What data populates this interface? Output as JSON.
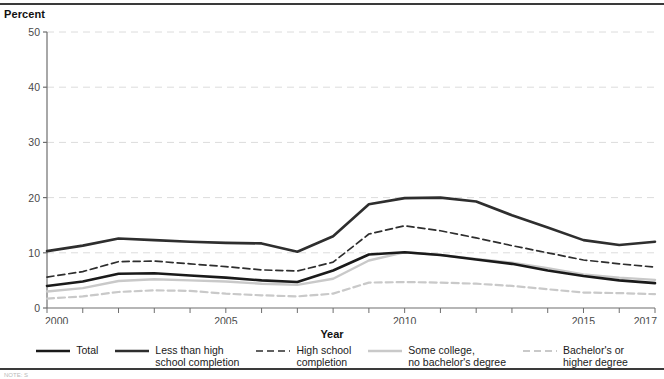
{
  "figure": {
    "y_axis_title": "Percent",
    "x_axis_title": "Year",
    "footnote": "NOTE: S"
  },
  "legend": {
    "items": [
      {
        "label": "Total",
        "style": "solid",
        "color": "#1a1a1a",
        "width": 2.6
      },
      {
        "label": "Less than high\nschool completion",
        "style": "solid",
        "color": "#2e2e2e",
        "width": 2.6
      },
      {
        "label": "High school\ncompletion",
        "style": "dashed",
        "color": "#2e2e2e",
        "width": 1.7
      },
      {
        "label": "Some college,\nno bachelor's degree",
        "style": "solid",
        "color": "#c9c9c9",
        "width": 2.4
      },
      {
        "label": "Bachelor's or\nhigher degree",
        "style": "dashed",
        "color": "#c9c9c9",
        "width": 2.2
      }
    ]
  },
  "chart_data": {
    "type": "line",
    "title": "",
    "xlabel": "Year",
    "ylabel": "Percent",
    "xlim": [
      2000,
      2017
    ],
    "ylim": [
      0,
      50
    ],
    "yticks": [
      0,
      10,
      20,
      30,
      40,
      50
    ],
    "xticks": [
      2000,
      2005,
      2010,
      2015,
      2017
    ],
    "xtick_labels": [
      "2000",
      "2005",
      "2010",
      "2015",
      "2017"
    ],
    "minor_xticks_every": 1,
    "grid": "horizontal-dashed-light",
    "legend_position": "bottom",
    "x": [
      2000,
      2001,
      2002,
      2003,
      2004,
      2005,
      2006,
      2007,
      2008,
      2009,
      2010,
      2011,
      2012,
      2013,
      2014,
      2015,
      2016,
      2017
    ],
    "series": [
      {
        "name": "Total",
        "style": "solid",
        "color": "#1a1a1a",
        "values": [
          4.0,
          4.8,
          6.2,
          6.3,
          5.9,
          5.5,
          5.0,
          4.7,
          6.8,
          9.7,
          10.1,
          9.6,
          8.8,
          8.0,
          6.8,
          5.8,
          5.0,
          4.5
        ]
      },
      {
        "name": "Less than high school completion",
        "style": "solid",
        "color": "#2e2e2e",
        "values": [
          10.3,
          11.3,
          12.6,
          12.3,
          12.0,
          11.8,
          11.7,
          10.2,
          13.0,
          18.8,
          19.9,
          20.0,
          19.3,
          16.8,
          14.6,
          12.3,
          11.4,
          12.0
        ]
      },
      {
        "name": "High school completion",
        "style": "dashed",
        "color": "#2e2e2e",
        "values": [
          5.6,
          6.6,
          8.4,
          8.5,
          8.0,
          7.5,
          6.9,
          6.7,
          8.3,
          13.4,
          14.9,
          14.0,
          12.7,
          11.3,
          10.0,
          8.7,
          8.0,
          7.4
        ]
      },
      {
        "name": "Some college, no bachelor's degree",
        "style": "solid",
        "color": "#c9c9c9",
        "values": [
          3.0,
          3.6,
          4.9,
          5.2,
          5.0,
          4.8,
          4.4,
          4.2,
          5.3,
          8.6,
          10.1,
          9.6,
          8.9,
          8.2,
          7.2,
          6.1,
          5.5,
          5.1
        ]
      },
      {
        "name": "Bachelor's or higher degree",
        "style": "dashed",
        "color": "#c9c9c9",
        "values": [
          1.7,
          2.1,
          2.9,
          3.2,
          3.1,
          2.6,
          2.3,
          2.1,
          2.6,
          4.6,
          4.7,
          4.6,
          4.4,
          4.0,
          3.4,
          2.8,
          2.7,
          2.5
        ]
      }
    ]
  }
}
